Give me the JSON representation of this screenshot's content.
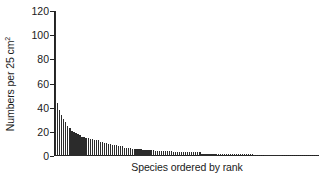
{
  "chart_data": {
    "type": "bar",
    "title": "",
    "subtitle": "",
    "xlabel": "Species ordered by rank",
    "ylabel": "Numbers per 25 cm2",
    "ylabel_text": "Numbers per 25 cm",
    "ylabel_superscript": "2",
    "ylim": [
      0,
      120
    ],
    "yticks": [
      0,
      20,
      40,
      60,
      80,
      100,
      120
    ],
    "ytick_labels": [
      "0",
      "20",
      "40",
      "60",
      "80",
      "100",
      "120"
    ],
    "xticks": [],
    "xtick_labels": [],
    "grid": false,
    "legend": false,
    "bar_color": "#2b2b2b",
    "axis_color": "#222222",
    "background_color": "#ffffff",
    "n_bars": 130,
    "categories": [
      "1",
      "2",
      "3",
      "4",
      "5",
      "6",
      "7",
      "8",
      "9",
      "10",
      "11",
      "12",
      "13",
      "14",
      "15",
      "16",
      "17",
      "18",
      "19",
      "20",
      "21",
      "22",
      "23",
      "24",
      "25",
      "26",
      "27",
      "28",
      "29",
      "30",
      "31",
      "32",
      "33",
      "34",
      "35",
      "36",
      "37",
      "38",
      "39",
      "40",
      "41",
      "42",
      "43",
      "44",
      "45",
      "46",
      "47",
      "48",
      "49",
      "50",
      "51",
      "52",
      "53",
      "54",
      "55",
      "56",
      "57",
      "58",
      "59",
      "60",
      "61",
      "62",
      "63",
      "64",
      "65",
      "66",
      "67",
      "68",
      "69",
      "70",
      "71",
      "72",
      "73",
      "74",
      "75",
      "76",
      "77",
      "78",
      "79",
      "80",
      "81",
      "82",
      "83",
      "84",
      "85",
      "86",
      "87",
      "88",
      "89",
      "90",
      "91",
      "92",
      "93",
      "94",
      "95",
      "96",
      "97",
      "98",
      "99",
      "100",
      "101",
      "102",
      "103",
      "104",
      "105",
      "106",
      "107",
      "108",
      "109",
      "110",
      "111",
      "112",
      "113",
      "114",
      "115",
      "116",
      "117",
      "118",
      "119",
      "120",
      "121",
      "122",
      "123",
      "124",
      "125",
      "126",
      "127",
      "128",
      "129",
      "130"
    ],
    "values": [
      120,
      44,
      38,
      34,
      31,
      28,
      25,
      23,
      21,
      20,
      19,
      18,
      17,
      16,
      16,
      15,
      15,
      14,
      14,
      13,
      13,
      13,
      12,
      12,
      11,
      11,
      10,
      10,
      9,
      9,
      9,
      8,
      8,
      8,
      7,
      7,
      7,
      7,
      6,
      6,
      6,
      6,
      6,
      5,
      5,
      5,
      5,
      5,
      5,
      4,
      4,
      4,
      4,
      4,
      4,
      4,
      4,
      4,
      3,
      3,
      3,
      3,
      3,
      3,
      3,
      3,
      3,
      3,
      3,
      3,
      3,
      3,
      2,
      2,
      2,
      2,
      2,
      2,
      2,
      2,
      2,
      2,
      2,
      2,
      2,
      2,
      2,
      2,
      2,
      2,
      2,
      2,
      2,
      2,
      2,
      2,
      2,
      2,
      1,
      1,
      1,
      1,
      1,
      1,
      1,
      1,
      1,
      1,
      1,
      1,
      1,
      1,
      1,
      1,
      1,
      1,
      1,
      1,
      1,
      1,
      1,
      1,
      1,
      1,
      1,
      1,
      1,
      1,
      1,
      1
    ]
  }
}
